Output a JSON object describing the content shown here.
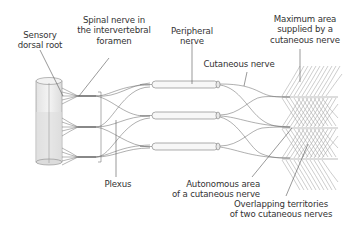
{
  "diagram": {
    "labels": {
      "sensory_dorsal_root": "Sensory\ndorsal root",
      "spinal_nerve_foramen": "Spinal nerve in\nthe intervertebral\nforamen",
      "peripheral_nerve": "Peripheral\nnerve",
      "maximum_area": "Maximum area\nsupplied by a\ncutaneous nerve",
      "cutaneous_nerve": "Cutaneous nerve",
      "plexus": "Plexus",
      "autonomous_area": "Autonomous area\nof a cutaneous nerve",
      "overlapping_territories": "Overlapping territories\nof two cutaneous nerves"
    },
    "structures": [
      "spinal cord segment",
      "three dorsal root bundles",
      "plexus",
      "three peripheral nerve sheaths",
      "cutaneous nerves",
      "skin territory hatching"
    ],
    "colors": {
      "line": "#6e6e6e",
      "text": "#333333",
      "cord_fill": "#e9e9e9",
      "cord_shade": "#d9d9d9",
      "hatch": "#9a9a9a"
    }
  }
}
